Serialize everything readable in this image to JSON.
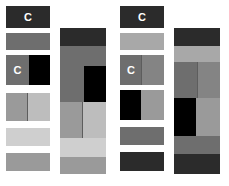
{
  "figure": {
    "background_color": "#ffffff",
    "width": 229,
    "height": 186
  },
  "palette": {
    "black": "#000000",
    "near_black": "#1f1f1f",
    "dark_gray": "#2b2b2b",
    "mid_dark_gray": "#595959",
    "mid_gray": "#6e6e6e",
    "gray": "#848484",
    "light_mid_gray": "#9a9a9a",
    "light_gray": "#a8a8a8",
    "pale_gray": "#bdbdbd",
    "very_pale_gray": "#cfcfcf",
    "divider": "#5d5d5d"
  },
  "groups": [
    {
      "id": "left",
      "name": "left-group",
      "tile_column": {
        "name": "left-group-tile-column",
        "tiles": [
          {
            "name": "tile-1",
            "top": 6,
            "height": 22,
            "label": "C",
            "label_color": "#ffffff",
            "halves": [
              {
                "name": "tile-1-fill",
                "width_pct": 100,
                "color": "#2b2b2b",
                "divider": false
              }
            ]
          },
          {
            "name": "tile-2",
            "top": 33,
            "height": 17,
            "label": "",
            "label_color": "#ffffff",
            "halves": [
              {
                "name": "tile-2-fill",
                "width_pct": 100,
                "color": "#6e6e6e",
                "divider": false
              }
            ]
          },
          {
            "name": "tile-3",
            "top": 55,
            "height": 30,
            "label": "C",
            "label_color": "#ffffff",
            "halves": [
              {
                "name": "tile-3-left",
                "width_pct": 52,
                "color": "#6e6e6e",
                "divider": false
              },
              {
                "name": "tile-3-right",
                "width_pct": 48,
                "color": "#000000",
                "divider": false
              }
            ]
          },
          {
            "name": "tile-4",
            "top": 93,
            "height": 28,
            "label": "",
            "label_color": "#ffffff",
            "halves": [
              {
                "name": "tile-4-left",
                "width_pct": 50,
                "color": "#9a9a9a",
                "divider": true
              },
              {
                "name": "tile-4-right",
                "width_pct": 50,
                "color": "#bdbdbd",
                "divider": false
              }
            ]
          },
          {
            "name": "tile-5",
            "top": 128,
            "height": 18,
            "label": "",
            "label_color": "#ffffff",
            "halves": [
              {
                "name": "tile-5-fill",
                "width_pct": 100,
                "color": "#cfcfcf",
                "divider": false
              }
            ]
          },
          {
            "name": "tile-6",
            "top": 153,
            "height": 18,
            "label": "",
            "label_color": "#ffffff",
            "halves": [
              {
                "name": "tile-6-fill",
                "width_pct": 100,
                "color": "#9a9a9a",
                "divider": false
              }
            ]
          }
        ]
      },
      "stack_bar": {
        "name": "left-group-stack-bar",
        "segments": [
          {
            "name": "segment-1",
            "height": 18,
            "halves": [
              {
                "name": "segment-1-fill",
                "width_pct": 100,
                "color": "#2b2b2b",
                "divider": false
              }
            ]
          },
          {
            "name": "segment-2",
            "height": 20,
            "halves": [
              {
                "name": "segment-2-fill",
                "width_pct": 100,
                "color": "#6e6e6e",
                "divider": false
              }
            ]
          },
          {
            "name": "segment-3",
            "height": 36,
            "halves": [
              {
                "name": "segment-3-left",
                "width_pct": 52,
                "color": "#6e6e6e",
                "divider": false
              },
              {
                "name": "segment-3-right",
                "width_pct": 48,
                "color": "#000000",
                "divider": false
              }
            ]
          },
          {
            "name": "segment-4",
            "height": 36,
            "halves": [
              {
                "name": "segment-4-left",
                "width_pct": 50,
                "color": "#9a9a9a",
                "divider": true
              },
              {
                "name": "segment-4-right",
                "width_pct": 50,
                "color": "#bdbdbd",
                "divider": false
              }
            ]
          },
          {
            "name": "segment-5",
            "height": 19,
            "halves": [
              {
                "name": "segment-5-fill",
                "width_pct": 100,
                "color": "#cfcfcf",
                "divider": false
              }
            ]
          },
          {
            "name": "segment-6",
            "height": 17,
            "halves": [
              {
                "name": "segment-6-fill",
                "width_pct": 100,
                "color": "#9a9a9a",
                "divider": false
              }
            ]
          }
        ]
      }
    },
    {
      "id": "right",
      "name": "right-group",
      "tile_column": {
        "name": "right-group-tile-column",
        "tiles": [
          {
            "name": "tile-1",
            "top": 6,
            "height": 22,
            "label": "C",
            "label_color": "#ffffff",
            "halves": [
              {
                "name": "tile-1-fill",
                "width_pct": 100,
                "color": "#2b2b2b",
                "divider": false
              }
            ]
          },
          {
            "name": "tile-2",
            "top": 33,
            "height": 17,
            "label": "",
            "label_color": "#ffffff",
            "halves": [
              {
                "name": "tile-2-fill",
                "width_pct": 100,
                "color": "#a8a8a8",
                "divider": false
              }
            ]
          },
          {
            "name": "tile-3",
            "top": 55,
            "height": 30,
            "label": "C",
            "label_color": "#ffffff",
            "halves": [
              {
                "name": "tile-3-left",
                "width_pct": 50,
                "color": "#6e6e6e",
                "divider": true
              },
              {
                "name": "tile-3-right",
                "width_pct": 50,
                "color": "#848484",
                "divider": false
              }
            ]
          },
          {
            "name": "tile-4",
            "top": 90,
            "height": 30,
            "label": "",
            "label_color": "#ffffff",
            "halves": [
              {
                "name": "tile-4-left",
                "width_pct": 48,
                "color": "#000000",
                "divider": false
              },
              {
                "name": "tile-4-right",
                "width_pct": 52,
                "color": "#9a9a9a",
                "divider": false
              }
            ]
          },
          {
            "name": "tile-5",
            "top": 127,
            "height": 18,
            "label": "",
            "label_color": "#ffffff",
            "halves": [
              {
                "name": "tile-5-fill",
                "width_pct": 100,
                "color": "#6e6e6e",
                "divider": false
              }
            ]
          },
          {
            "name": "tile-6",
            "top": 152,
            "height": 19,
            "label": "",
            "label_color": "#ffffff",
            "halves": [
              {
                "name": "tile-6-fill",
                "width_pct": 100,
                "color": "#2b2b2b",
                "divider": false
              }
            ]
          }
        ]
      },
      "stack_bar": {
        "name": "right-group-stack-bar",
        "segments": [
          {
            "name": "segment-1",
            "height": 18,
            "halves": [
              {
                "name": "segment-1-fill",
                "width_pct": 100,
                "color": "#2b2b2b",
                "divider": false
              }
            ]
          },
          {
            "name": "segment-2",
            "height": 16,
            "halves": [
              {
                "name": "segment-2-fill",
                "width_pct": 100,
                "color": "#a8a8a8",
                "divider": false
              }
            ]
          },
          {
            "name": "segment-3",
            "height": 36,
            "halves": [
              {
                "name": "segment-3-left",
                "width_pct": 52,
                "color": "#6e6e6e",
                "divider": true
              },
              {
                "name": "segment-3-right",
                "width_pct": 48,
                "color": "#848484",
                "divider": false
              }
            ]
          },
          {
            "name": "segment-4",
            "height": 38,
            "halves": [
              {
                "name": "segment-4-left",
                "width_pct": 48,
                "color": "#000000",
                "divider": false
              },
              {
                "name": "segment-4-right",
                "width_pct": 52,
                "color": "#9a9a9a",
                "divider": false
              }
            ]
          },
          {
            "name": "segment-5",
            "height": 18,
            "halves": [
              {
                "name": "segment-5-fill",
                "width_pct": 100,
                "color": "#6e6e6e",
                "divider": false
              }
            ]
          },
          {
            "name": "segment-6",
            "height": 20,
            "halves": [
              {
                "name": "segment-6-fill",
                "width_pct": 100,
                "color": "#2b2b2b",
                "divider": false
              }
            ]
          }
        ]
      }
    }
  ],
  "caption_fragments": [
    {
      "name": "caption-fragment-1",
      "left": 28,
      "text": "—"
    },
    {
      "name": "caption-fragment-2",
      "left": 68,
      "text": "-  -   -"
    },
    {
      "name": "caption-fragment-3",
      "left": 140,
      "text": "-  -"
    },
    {
      "name": "caption-fragment-4",
      "left": 168,
      "text": "—"
    }
  ]
}
